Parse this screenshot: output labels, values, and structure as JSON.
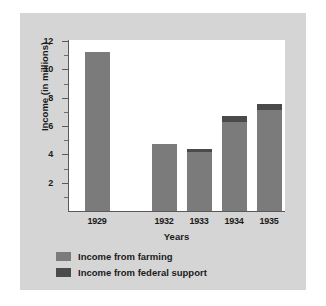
{
  "chart_data": {
    "type": "bar",
    "stacked": true,
    "title": "",
    "xlabel": "Years",
    "ylabel": "Income (in millions)",
    "categories": [
      "1929",
      "1932",
      "1933",
      "1934",
      "1935"
    ],
    "series": [
      {
        "name": "Income from farming",
        "color": "#7b7b7b",
        "values": [
          11.2,
          4.7,
          4.15,
          6.3,
          7.1
        ]
      },
      {
        "name": "Income from federal support",
        "color": "#4a4a4a",
        "values": [
          0,
          0,
          0.25,
          0.4,
          0.45
        ]
      }
    ],
    "totals": [
      11.2,
      4.7,
      4.4,
      6.7,
      7.55
    ],
    "ylim": [
      0,
      12
    ],
    "ytick_labels": [
      "2",
      "4",
      "6",
      "8",
      "10",
      "12"
    ],
    "ytick_values": [
      2,
      4,
      6,
      8,
      10,
      12
    ],
    "yminor_values": [
      1,
      3,
      5,
      7,
      9,
      11
    ],
    "grid": false,
    "legend_position": "below-left",
    "category_gap_after": "1929"
  },
  "legend": {
    "entries": [
      {
        "label": "Income from farming",
        "color": "#7b7b7b"
      },
      {
        "label": "Income from federal support",
        "color": "#4a4a4a"
      }
    ]
  },
  "axis": {
    "x_title": "Years",
    "y_title": "Income (in millions)"
  },
  "colors": {
    "panel_background": "#d5d5d5",
    "plot_background": "#ffffff",
    "axis_line": "#5a5a5a",
    "text": "#1a1a1a"
  }
}
